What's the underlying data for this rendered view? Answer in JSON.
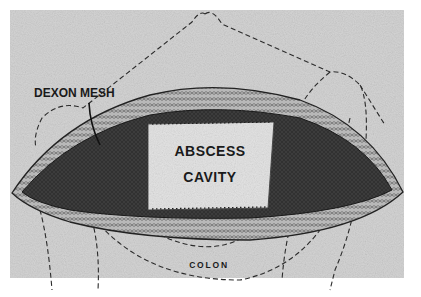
{
  "figure": {
    "labels": {
      "mesh": "DEXON MESH",
      "cavity_line1": "ABSCESS",
      "cavity_line2": "CAVITY",
      "colon": "COLON"
    },
    "colors": {
      "background": "#d6d6d6",
      "mesh_dark": "#3a3a3a",
      "cavity_fill": "#e2e2e2",
      "tissue": "#9a9a9a",
      "ink": "#1a1a1a"
    }
  }
}
